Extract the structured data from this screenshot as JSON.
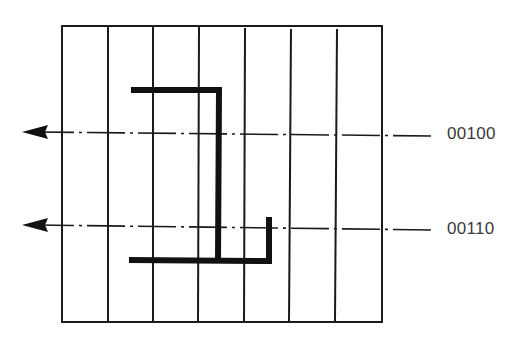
{
  "diagram": {
    "grid": {
      "columns": 7,
      "left": 62,
      "top": 26,
      "right": 382,
      "bottom": 322
    },
    "scan_lines": [
      {
        "label": "00100",
        "y": 133
      },
      {
        "label": "00110",
        "y": 227
      }
    ],
    "colors": {
      "line": "#1a1a1a",
      "shape": "#111111",
      "text": "#3a3a3a"
    }
  }
}
